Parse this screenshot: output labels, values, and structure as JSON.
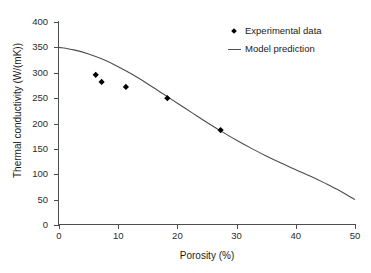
{
  "chart_data": {
    "type": "scatter",
    "title": "",
    "xlabel": "Porosity (%)",
    "ylabel": "Thermal conductivity (W/(mK))",
    "xlim": [
      0,
      50
    ],
    "ylim": [
      0,
      400
    ],
    "xticks": [
      "0",
      "10",
      "20",
      "30",
      "40",
      "50"
    ],
    "xtick_values": [
      0,
      10,
      20,
      30,
      40,
      50
    ],
    "yticks": [
      "0",
      "50",
      "100",
      "150",
      "200",
      "250",
      "300",
      "350",
      "400"
    ],
    "ytick_values": [
      0,
      50,
      100,
      150,
      200,
      250,
      300,
      350,
      400
    ],
    "grid": false,
    "legend_position": "top-right",
    "series": [
      {
        "name": "Experimental data",
        "type": "scatter",
        "marker": "diamond",
        "color": "#000000",
        "x": [
          6.2,
          7.2,
          11.3,
          18.3,
          27.3
        ],
        "y": [
          296,
          282,
          272,
          250,
          187
        ]
      },
      {
        "name": "Model prediction",
        "type": "line",
        "color": "#4d4d4d",
        "x": [
          0,
          2.5,
          5,
          7.5,
          10,
          12.5,
          15,
          17.5,
          20,
          22.5,
          25,
          27.5,
          30,
          32.5,
          35,
          37.5,
          40,
          42.5,
          45,
          47.5,
          50
        ],
        "y": [
          350,
          345,
          337,
          326,
          312,
          296,
          278,
          259,
          240,
          221,
          202,
          184,
          167,
          151,
          136,
          122,
          109,
          96,
          82,
          67,
          50
        ]
      }
    ]
  },
  "legend": {
    "items": [
      {
        "label": "Experimental data",
        "key": "diamond-marker"
      },
      {
        "label": "Model prediction",
        "key": "line-marker"
      }
    ]
  }
}
